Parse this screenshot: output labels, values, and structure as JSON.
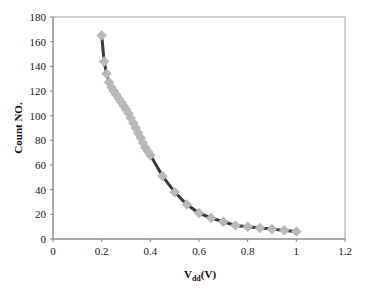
{
  "chart_data": {
    "type": "line",
    "title": "",
    "xlabel_main": "V",
    "xlabel_sub": "dd",
    "xlabel_unit": "(V)",
    "ylabel": "Count NO.",
    "xlim": [
      0,
      1.2
    ],
    "ylim": [
      0,
      180
    ],
    "x_ticks": [
      "0",
      "0.2",
      "0.4",
      "0.6",
      "0.8",
      "1",
      "1.2"
    ],
    "y_ticks": [
      "0",
      "20",
      "40",
      "60",
      "80",
      "100",
      "120",
      "140",
      "160",
      "180"
    ],
    "grid": false,
    "legend": "none",
    "line_color": "#3a3a3a",
    "marker_color": "#b8b8b8",
    "marker": "diamond",
    "series": [
      {
        "name": "Count",
        "x": [
          0.2,
          0.21,
          0.22,
          0.23,
          0.24,
          0.25,
          0.26,
          0.27,
          0.28,
          0.29,
          0.3,
          0.31,
          0.32,
          0.33,
          0.34,
          0.35,
          0.36,
          0.37,
          0.38,
          0.39,
          0.4,
          0.45,
          0.5,
          0.55,
          0.6,
          0.65,
          0.7,
          0.75,
          0.8,
          0.85,
          0.9,
          0.95,
          1.0
        ],
        "y": [
          165,
          144,
          134,
          127,
          123,
          120,
          117,
          114,
          111,
          108,
          105,
          102,
          98,
          94,
          90,
          86,
          82,
          78,
          74,
          71,
          68,
          51,
          38,
          28,
          21,
          17,
          14,
          11,
          10,
          9,
          8,
          7,
          6
        ]
      }
    ]
  }
}
